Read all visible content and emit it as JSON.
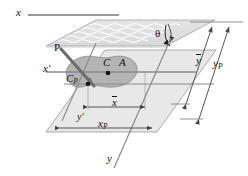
{
  "figure": {
    "name": "inclined-submerged-plane-hydrostatics"
  },
  "axes": {
    "x_label": "x",
    "x_prime_label": "x'",
    "y_label": "y",
    "y_prime_label": "y'"
  },
  "angle": {
    "theta_label": "θ"
  },
  "points": {
    "centroid_label": "C",
    "area_label": "A",
    "center_of_pressure_label": "C",
    "center_of_pressure_sub": "P"
  },
  "force": {
    "label": "P"
  },
  "dimensions": {
    "x_bar": "x",
    "x_p_base": "x",
    "x_p_sub": "P",
    "y_bar": "y",
    "y_p_base": "y",
    "y_p_sub": "P"
  },
  "colors": {
    "free_surface_fill": "#e2e2e2",
    "free_surface_edge": "#9a9a9a",
    "inclined_plane_fill": "#e8e8e8",
    "inclined_plane_edge": "#8c8c8c",
    "area_fill": "#b4b4b4",
    "area_edge": "#7d7d7d",
    "line": "#555555",
    "force_arrow": "#6d6d6d",
    "text": "#111111"
  }
}
